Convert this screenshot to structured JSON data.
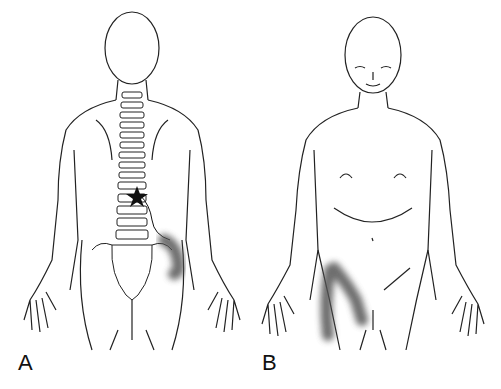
{
  "figure": {
    "panels": [
      {
        "label": "A",
        "view": "posterior body outline with spine",
        "marker": "star at lower thoracic spine",
        "pain_region": "shaded band over left flank/iliac crest"
      },
      {
        "label": "B",
        "view": "anterior body outline",
        "pain_region": "shaded band over right groin and anterior thigh"
      }
    ],
    "colors": {
      "line": "#222222",
      "shading": "#555555",
      "background": "#ffffff"
    }
  }
}
